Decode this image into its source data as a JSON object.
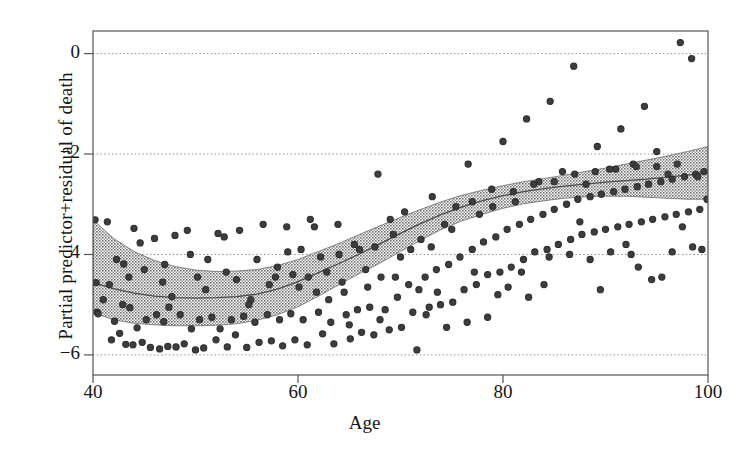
{
  "chart_data": {
    "type": "scatter",
    "title": "",
    "subtitle": "",
    "xlabel": "Age",
    "ylabel": "Partial predictor+residual of death",
    "xlim": [
      40,
      100
    ],
    "ylim": [
      -6.4,
      0.45
    ],
    "xticks": [
      40,
      60,
      80,
      100
    ],
    "xtick_labels": [
      "40",
      "60",
      "80",
      "100"
    ],
    "yticks": [
      0,
      -2,
      -4,
      -6
    ],
    "ytick_labels": [
      "0",
      "−2",
      "−4",
      "−6"
    ],
    "grid": "horizontal-dotted",
    "legend": "none",
    "colors": {
      "point": "#2e2e2e",
      "point_fill": "#3d3d3d",
      "band": "#9a9a9a",
      "curve": "#4a4a4a",
      "frame": "#555555",
      "gridline": "#8a8a8a",
      "background": "#ffffff"
    },
    "series": [
      {
        "name": "smooth fit",
        "type": "line",
        "x": [
          40,
          42,
          44,
          46,
          48,
          50,
          52,
          54,
          56,
          58,
          60,
          62,
          64,
          66,
          68,
          70,
          72,
          74,
          76,
          78,
          80,
          82,
          84,
          86,
          88,
          90,
          92,
          94,
          96,
          98,
          100
        ],
        "y": [
          -4.56,
          -4.68,
          -4.77,
          -4.83,
          -4.86,
          -4.87,
          -4.86,
          -4.84,
          -4.79,
          -4.69,
          -4.54,
          -4.36,
          -4.18,
          -3.99,
          -3.79,
          -3.58,
          -3.38,
          -3.2,
          -3.05,
          -2.93,
          -2.83,
          -2.75,
          -2.69,
          -2.64,
          -2.6,
          -2.56,
          -2.53,
          -2.5,
          -2.46,
          -2.42,
          -2.37
        ]
      },
      {
        "name": "confidence band upper",
        "type": "band-upper",
        "x": [
          40,
          42,
          44,
          46,
          48,
          50,
          52,
          54,
          56,
          58,
          60,
          62,
          64,
          66,
          68,
          70,
          72,
          74,
          76,
          78,
          80,
          82,
          84,
          86,
          88,
          90,
          92,
          94,
          96,
          98,
          100
        ],
        "y": [
          -3.31,
          -3.68,
          -3.94,
          -4.12,
          -4.24,
          -4.31,
          -4.34,
          -4.33,
          -4.3,
          -4.22,
          -4.1,
          -3.94,
          -3.78,
          -3.6,
          -3.43,
          -3.26,
          -3.1,
          -2.95,
          -2.82,
          -2.72,
          -2.63,
          -2.55,
          -2.49,
          -2.42,
          -2.35,
          -2.28,
          -2.2,
          -2.12,
          -2.04,
          -1.95,
          -1.85
        ]
      },
      {
        "name": "confidence band lower",
        "type": "band-lower",
        "x": [
          40,
          42,
          44,
          46,
          48,
          50,
          52,
          54,
          56,
          58,
          60,
          62,
          64,
          66,
          68,
          70,
          72,
          74,
          76,
          78,
          80,
          82,
          84,
          86,
          88,
          90,
          92,
          94,
          96,
          98,
          100
        ],
        "y": [
          -5.16,
          -5.3,
          -5.37,
          -5.4,
          -5.42,
          -5.42,
          -5.41,
          -5.38,
          -5.31,
          -5.2,
          -5.04,
          -4.83,
          -4.6,
          -4.38,
          -4.17,
          -3.94,
          -3.71,
          -3.5,
          -3.33,
          -3.2,
          -3.08,
          -2.99,
          -2.93,
          -2.88,
          -2.85,
          -2.84,
          -2.84,
          -2.86,
          -2.88,
          -2.9,
          -2.9
        ]
      },
      {
        "name": "partial residuals",
        "type": "scatter-points",
        "points": [
          [
            40.2,
            -3.31
          ],
          [
            40.3,
            -4.56
          ],
          [
            40.4,
            -5.15
          ],
          [
            40.5,
            -5.18
          ],
          [
            41.4,
            -3.35
          ],
          [
            41.6,
            -4.6
          ],
          [
            41.8,
            -5.7
          ],
          [
            42.1,
            -5.33
          ],
          [
            42.6,
            -5.57
          ],
          [
            43.0,
            -4.19
          ],
          [
            43.2,
            -5.79
          ],
          [
            43.6,
            -5.06
          ],
          [
            43.9,
            -5.8
          ],
          [
            44.3,
            -5.46
          ],
          [
            44.6,
            -3.77
          ],
          [
            44.8,
            -5.75
          ],
          [
            45.2,
            -5.3
          ],
          [
            45.6,
            -5.85
          ],
          [
            46.0,
            -3.68
          ],
          [
            46.2,
            -5.2
          ],
          [
            46.5,
            -5.88
          ],
          [
            46.9,
            -5.34
          ],
          [
            47.3,
            -5.83
          ],
          [
            47.7,
            -4.84
          ],
          [
            48.1,
            -5.84
          ],
          [
            48.5,
            -5.2
          ],
          [
            48.9,
            -5.78
          ],
          [
            49.2,
            -3.52
          ],
          [
            49.6,
            -5.48
          ],
          [
            50.0,
            -5.9
          ],
          [
            50.4,
            -5.3
          ],
          [
            50.8,
            -5.86
          ],
          [
            51.2,
            -4.1
          ],
          [
            51.6,
            -5.25
          ],
          [
            52.0,
            -5.7
          ],
          [
            52.4,
            -5.48
          ],
          [
            52.8,
            -3.65
          ],
          [
            53.1,
            -5.84
          ],
          [
            53.5,
            -5.3
          ],
          [
            53.9,
            -5.6
          ],
          [
            54.3,
            -3.52
          ],
          [
            54.7,
            -5.23
          ],
          [
            55.0,
            -5.85
          ],
          [
            55.4,
            -4.9
          ],
          [
            55.8,
            -5.35
          ],
          [
            56.2,
            -5.75
          ],
          [
            56.6,
            -3.4
          ],
          [
            57.0,
            -5.2
          ],
          [
            57.4,
            -5.72
          ],
          [
            57.8,
            -4.45
          ],
          [
            58.2,
            -5.3
          ],
          [
            58.5,
            -5.82
          ],
          [
            58.9,
            -3.45
          ],
          [
            59.3,
            -5.18
          ],
          [
            59.7,
            -5.7
          ],
          [
            60.1,
            -4.65
          ],
          [
            60.5,
            -5.3
          ],
          [
            60.9,
            -5.8
          ],
          [
            61.2,
            -3.3
          ],
          [
            61.6,
            -3.45
          ],
          [
            62.0,
            -5.15
          ],
          [
            62.4,
            -5.58
          ],
          [
            62.8,
            -4.35
          ],
          [
            63.2,
            -5.35
          ],
          [
            63.5,
            -5.78
          ],
          [
            63.9,
            -3.4
          ],
          [
            64.3,
            -4.55
          ],
          [
            64.7,
            -5.2
          ],
          [
            65.1,
            -5.68
          ],
          [
            65.5,
            -3.8
          ],
          [
            65.8,
            -5.1
          ],
          [
            66.2,
            -5.55
          ],
          [
            66.6,
            -4.3
          ],
          [
            67.0,
            -5.05
          ],
          [
            67.4,
            -5.6
          ],
          [
            67.8,
            -2.4
          ],
          [
            68.1,
            -4.45
          ],
          [
            68.5,
            -5.1
          ],
          [
            68.9,
            -5.5
          ],
          [
            69.3,
            -3.6
          ],
          [
            69.7,
            -4.85
          ],
          [
            70.1,
            -5.45
          ],
          [
            70.4,
            -3.15
          ],
          [
            70.8,
            -4.6
          ],
          [
            71.2,
            -5.15
          ],
          [
            71.6,
            -5.9
          ],
          [
            72.0,
            -3.7
          ],
          [
            72.4,
            -4.45
          ],
          [
            72.8,
            -5.05
          ],
          [
            73.1,
            -2.85
          ],
          [
            73.5,
            -4.3
          ],
          [
            73.9,
            -5.0
          ],
          [
            74.3,
            -3.4
          ],
          [
            74.7,
            -4.2
          ],
          [
            75.1,
            -4.95
          ],
          [
            75.4,
            -3.05
          ],
          [
            75.8,
            -4.05
          ],
          [
            76.2,
            -4.7
          ],
          [
            76.6,
            -2.2
          ],
          [
            77.0,
            -3.9
          ],
          [
            77.4,
            -4.6
          ],
          [
            77.7,
            -3.2
          ],
          [
            78.1,
            -3.75
          ],
          [
            78.5,
            -4.4
          ],
          [
            78.9,
            -2.7
          ],
          [
            79.3,
            -3.65
          ],
          [
            79.7,
            -4.35
          ],
          [
            80.0,
            -1.75
          ],
          [
            80.4,
            -3.5
          ],
          [
            80.8,
            -4.25
          ],
          [
            81.2,
            -2.95
          ],
          [
            81.6,
            -3.4
          ],
          [
            82.0,
            -4.1
          ],
          [
            82.3,
            -1.3
          ],
          [
            82.7,
            -3.3
          ],
          [
            83.1,
            -3.95
          ],
          [
            83.5,
            -2.55
          ],
          [
            83.9,
            -3.2
          ],
          [
            84.3,
            -3.9
          ],
          [
            84.6,
            -0.95
          ],
          [
            85.0,
            -3.1
          ],
          [
            85.4,
            -3.8
          ],
          [
            85.8,
            -2.35
          ],
          [
            86.2,
            -3.0
          ],
          [
            86.6,
            -3.7
          ],
          [
            86.9,
            -0.25
          ],
          [
            87.3,
            -2.9
          ],
          [
            87.7,
            -3.6
          ],
          [
            88.1,
            -2.6
          ],
          [
            88.5,
            -2.85
          ],
          [
            88.9,
            -3.55
          ],
          [
            89.2,
            -1.85
          ],
          [
            89.6,
            -2.8
          ],
          [
            90.0,
            -3.5
          ],
          [
            90.4,
            -2.3
          ],
          [
            90.8,
            -2.75
          ],
          [
            91.2,
            -3.45
          ],
          [
            91.5,
            -1.5
          ],
          [
            91.9,
            -2.7
          ],
          [
            92.3,
            -3.4
          ],
          [
            92.7,
            -2.2
          ],
          [
            93.1,
            -2.65
          ],
          [
            93.5,
            -3.35
          ],
          [
            93.8,
            -1.05
          ],
          [
            94.2,
            -2.6
          ],
          [
            94.6,
            -3.3
          ],
          [
            95.0,
            -1.95
          ],
          [
            95.4,
            -2.55
          ],
          [
            95.8,
            -3.25
          ],
          [
            96.1,
            -2.4
          ],
          [
            96.5,
            -2.5
          ],
          [
            96.9,
            -3.2
          ],
          [
            97.3,
            0.22
          ],
          [
            97.7,
            -2.45
          ],
          [
            98.1,
            -3.15
          ],
          [
            98.4,
            -0.1
          ],
          [
            98.8,
            -2.4
          ],
          [
            99.2,
            -3.1
          ],
          [
            99.6,
            -2.35
          ],
          [
            99.9,
            -2.9
          ],
          [
            41.0,
            -4.9
          ],
          [
            42.3,
            -4.1
          ],
          [
            45.0,
            -4.3
          ],
          [
            47.0,
            -4.2
          ],
          [
            49.5,
            -4.0
          ],
          [
            51.0,
            -4.7
          ],
          [
            53.0,
            -4.35
          ],
          [
            54.0,
            -4.5
          ],
          [
            56.0,
            -4.1
          ],
          [
            58.0,
            -4.25
          ],
          [
            59.0,
            -3.95
          ],
          [
            61.0,
            -4.45
          ],
          [
            62.2,
            -4.05
          ],
          [
            64.0,
            -4.0
          ],
          [
            66.0,
            -3.9
          ],
          [
            67.5,
            -3.85
          ],
          [
            69.0,
            -3.3
          ],
          [
            71.0,
            -3.9
          ],
          [
            73.0,
            -3.85
          ],
          [
            75.0,
            -3.5
          ],
          [
            77.0,
            -2.95
          ],
          [
            79.0,
            -3.05
          ],
          [
            81.0,
            -2.75
          ],
          [
            83.0,
            -2.6
          ],
          [
            85.0,
            -2.55
          ],
          [
            87.0,
            -2.4
          ],
          [
            89.0,
            -2.35
          ],
          [
            91.0,
            -2.3
          ],
          [
            93.0,
            -2.25
          ],
          [
            95.0,
            -2.25
          ],
          [
            97.0,
            -2.2
          ],
          [
            99.0,
            -2.45
          ],
          [
            44.0,
            -3.48
          ],
          [
            48.0,
            -3.62
          ],
          [
            52.2,
            -3.58
          ],
          [
            60.3,
            -3.9
          ],
          [
            63.0,
            -4.9
          ],
          [
            65.0,
            -5.4
          ],
          [
            68.0,
            -5.3
          ],
          [
            70.0,
            -4.05
          ],
          [
            72.5,
            -5.2
          ],
          [
            74.5,
            -5.45
          ],
          [
            76.5,
            -5.35
          ],
          [
            78.5,
            -5.25
          ],
          [
            80.5,
            -4.65
          ],
          [
            82.5,
            -4.85
          ],
          [
            84.5,
            -4.05
          ],
          [
            86.5,
            -4.0
          ],
          [
            88.5,
            -4.1
          ],
          [
            90.5,
            -3.95
          ],
          [
            92.5,
            -4.0
          ],
          [
            94.5,
            -4.5
          ],
          [
            96.5,
            -3.95
          ],
          [
            98.5,
            -3.85
          ],
          [
            43.5,
            -4.45
          ],
          [
            46.8,
            -4.55
          ],
          [
            50.2,
            -4.45
          ],
          [
            57.2,
            -4.6
          ],
          [
            59.5,
            -4.4
          ],
          [
            66.8,
            -4.65
          ],
          [
            71.8,
            -4.7
          ],
          [
            77.2,
            -4.35
          ],
          [
            81.8,
            -4.35
          ],
          [
            87.5,
            -3.35
          ],
          [
            92.0,
            -3.8
          ],
          [
            95.5,
            -4.45
          ],
          [
            99.4,
            -3.9
          ],
          [
            42.9,
            -5.0
          ],
          [
            47.4,
            -5.05
          ],
          [
            55.2,
            -5.0
          ],
          [
            61.8,
            -4.75
          ],
          [
            64.5,
            -4.75
          ],
          [
            69.5,
            -4.45
          ],
          [
            73.6,
            -4.75
          ],
          [
            79.5,
            -4.8
          ],
          [
            84.0,
            -4.6
          ],
          [
            89.5,
            -4.7
          ],
          [
            93.2,
            -4.25
          ],
          [
            97.5,
            -3.45
          ]
        ]
      }
    ]
  }
}
